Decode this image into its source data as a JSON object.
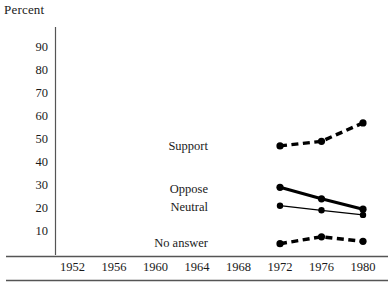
{
  "chart_data": {
    "type": "line",
    "title": "",
    "subtitle": "",
    "xlabel": "",
    "ylabel": "Percent",
    "x": [
      1952,
      1956,
      1960,
      1964,
      1968,
      1972,
      1976,
      1980
    ],
    "xtick_labels": [
      "1952",
      "1956",
      "1960",
      "1964",
      "1968",
      "1972",
      "1976",
      "1980"
    ],
    "ytick_labels": [
      "90",
      "80",
      "70",
      "60",
      "50",
      "40",
      "30",
      "20",
      "10"
    ],
    "yticks": [
      90,
      80,
      70,
      60,
      50,
      40,
      30,
      20,
      10
    ],
    "ylim": [
      0,
      95
    ],
    "xlim": [
      1950,
      1982
    ],
    "grid": false,
    "legend_position": "inline-left-of-series",
    "series": [
      {
        "name": "Support",
        "label": "Support",
        "style": "dashed-thick",
        "color": "#000000",
        "x": [
          1972,
          1976,
          1980
        ],
        "values": [
          47,
          49,
          57
        ]
      },
      {
        "name": "Oppose",
        "label": "Oppose",
        "style": "solid-thick",
        "color": "#000000",
        "x": [
          1972,
          1976,
          1980
        ],
        "values": [
          29,
          24,
          19.5
        ]
      },
      {
        "name": "Neutral",
        "label": "Neutral",
        "style": "solid-thin",
        "color": "#000000",
        "x": [
          1972,
          1976,
          1980
        ],
        "values": [
          21,
          19,
          17
        ]
      },
      {
        "name": "No answer",
        "label": "No answer",
        "style": "dashed-thick",
        "color": "#000000",
        "x": [
          1972,
          1976,
          1980
        ],
        "values": [
          4.5,
          7.5,
          5.5
        ]
      }
    ]
  }
}
